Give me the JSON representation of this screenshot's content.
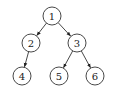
{
  "diagram": {
    "type": "binary-tree",
    "nodes": [
      {
        "id": "1",
        "label": "1",
        "x": 52,
        "y": 16
      },
      {
        "id": "2",
        "label": "2",
        "x": 31,
        "y": 43
      },
      {
        "id": "3",
        "label": "3",
        "x": 77,
        "y": 43
      },
      {
        "id": "4",
        "label": "4",
        "x": 22,
        "y": 76
      },
      {
        "id": "5",
        "label": "5",
        "x": 59,
        "y": 76
      },
      {
        "id": "6",
        "label": "6",
        "x": 95,
        "y": 76
      }
    ],
    "edges": [
      {
        "from": "1",
        "to": "2"
      },
      {
        "from": "1",
        "to": "3"
      },
      {
        "from": "2",
        "to": "4"
      },
      {
        "from": "3",
        "to": "5"
      },
      {
        "from": "3",
        "to": "6"
      }
    ],
    "node_radius": 9,
    "colors": {
      "stroke": "#333333",
      "fill": "#ffffff",
      "text": "#222222"
    }
  }
}
